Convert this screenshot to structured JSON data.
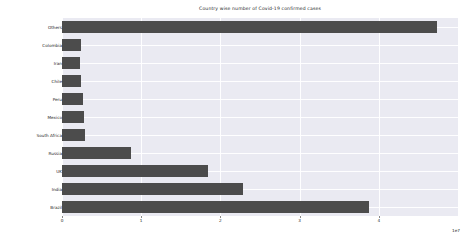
{
  "figure": {
    "width": 474,
    "height": 243,
    "background": "#ffffff",
    "plot_background": "#eaeaf2",
    "bar_color": "#4c4c4c",
    "grid_color": "#ffffff",
    "text_color": "#262626"
  },
  "chart_data": {
    "type": "bar",
    "orientation": "horizontal",
    "title": "Country wise number of Covid-19 confirmed cases",
    "xlabel": "",
    "ylabel": "",
    "exponent_label": "1e7",
    "xlim": [
      0,
      5.0
    ],
    "ylim_note": "categorical",
    "grid": true,
    "legend": "none",
    "x_ticks": [
      0,
      1,
      2,
      3,
      4
    ],
    "x_tick_labels": [
      "0",
      "1",
      "2",
      "3",
      "4"
    ],
    "units": "confirmed cases (x1e7)",
    "categories": [
      "Others",
      "Colombia",
      "Iran",
      "Chile",
      "Peru",
      "Mexico",
      "South Africa",
      "Russia",
      "UK",
      "India",
      "Brazil"
    ],
    "values": [
      4.74,
      0.24,
      0.23,
      0.24,
      0.26,
      0.28,
      0.29,
      0.87,
      1.84,
      2.29,
      3.87
    ],
    "series": [
      {
        "name": "Confirmed cases",
        "values": [
          4.74,
          0.24,
          0.23,
          0.24,
          0.26,
          0.28,
          0.29,
          0.87,
          1.84,
          2.29,
          3.87
        ]
      }
    ]
  }
}
